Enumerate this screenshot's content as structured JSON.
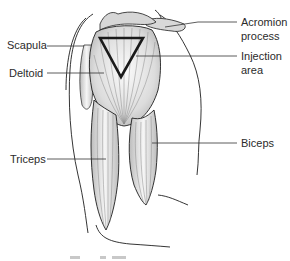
{
  "diagram": {
    "labels": {
      "scapula": "Scapula",
      "deltoid": "Deltoid",
      "triceps": "Triceps",
      "acromion": "Acromion\nprocess",
      "injection": "Injection\narea",
      "biceps": "Biceps"
    },
    "colors": {
      "outline": "#1e1e1e",
      "muscle_fill": "#e4e4e4",
      "muscle_shade": "#bdbdbd",
      "triangle": "#1a1a1a",
      "leader": "#333333",
      "text": "#2b2b2b"
    }
  }
}
